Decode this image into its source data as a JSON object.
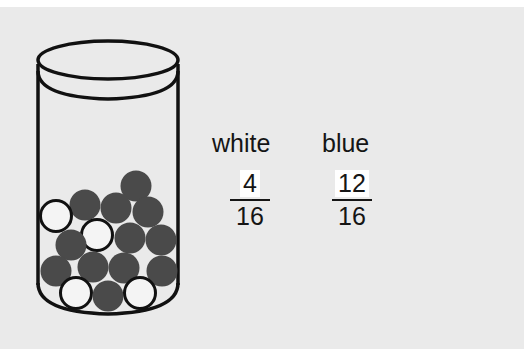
{
  "figure": {
    "background_color": "#eaeaea",
    "jar": {
      "marble_count_total": 16,
      "marbles": [
        {
          "color": "blue",
          "cx": 136,
          "cy": 186
        },
        {
          "color": "blue",
          "cx": 85,
          "cy": 205
        },
        {
          "color": "blue",
          "cx": 116,
          "cy": 208
        },
        {
          "color": "blue",
          "cx": 148,
          "cy": 212
        },
        {
          "color": "white",
          "cx": 56,
          "cy": 216
        },
        {
          "color": "white",
          "cx": 97,
          "cy": 235
        },
        {
          "color": "blue",
          "cx": 71,
          "cy": 245
        },
        {
          "color": "blue",
          "cx": 130,
          "cy": 238
        },
        {
          "color": "blue",
          "cx": 161,
          "cy": 240
        },
        {
          "color": "blue",
          "cx": 56,
          "cy": 271
        },
        {
          "color": "blue",
          "cx": 93,
          "cy": 267
        },
        {
          "color": "blue",
          "cx": 124,
          "cy": 268
        },
        {
          "color": "blue",
          "cx": 162,
          "cy": 271
        },
        {
          "color": "white",
          "cx": 76,
          "cy": 293
        },
        {
          "color": "blue",
          "cx": 108,
          "cy": 296
        },
        {
          "color": "white",
          "cx": 140,
          "cy": 293
        }
      ],
      "colors": {
        "blue": "#4a4a4a",
        "white": "#f4f4f4",
        "outline": "#111111"
      }
    },
    "labels": {
      "white": "white",
      "blue": "blue"
    },
    "fractions": {
      "white": {
        "numerator": "4",
        "denominator": "16"
      },
      "blue": {
        "numerator": "12",
        "denominator": "16"
      }
    }
  }
}
